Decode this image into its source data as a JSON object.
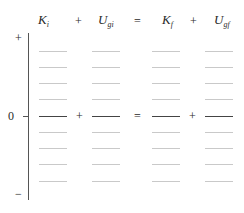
{
  "header": {
    "terms": [
      {
        "symbol": "K",
        "sub": "i"
      },
      {
        "symbol": "U",
        "sub": "gi"
      },
      {
        "symbol": "K",
        "sub": "f"
      },
      {
        "symbol": "U",
        "sub": "gf"
      }
    ],
    "operators": [
      "+",
      "=",
      "+"
    ]
  },
  "axis": {
    "top_label": "+",
    "zero_label": "0",
    "bottom_label": "−"
  },
  "zero_row": {
    "operators": [
      "+",
      "=",
      "+"
    ]
  },
  "grid": {
    "rows_above_zero": 4,
    "rows_below_zero": 4,
    "line_color": "#c9c9c9",
    "zero_line_color": "#444444"
  }
}
